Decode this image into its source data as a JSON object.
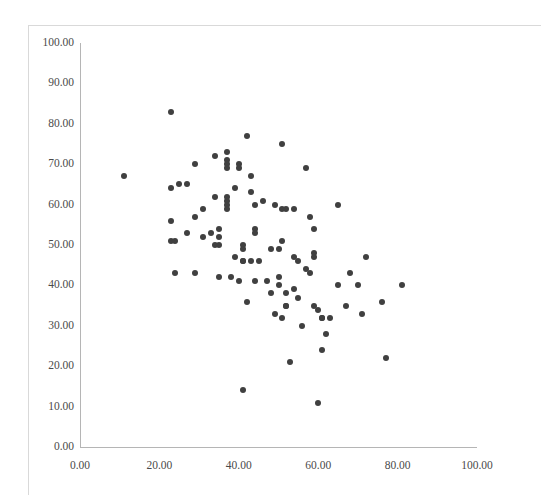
{
  "chart_data": {
    "type": "scatter",
    "title": "",
    "xlabel": "",
    "ylabel": "",
    "xlim": [
      0,
      100
    ],
    "ylim": [
      0,
      100
    ],
    "grid": false,
    "legend": null,
    "marker": {
      "shape": "circle",
      "color": "#404040",
      "size_px": 6
    },
    "x_ticks": [
      "0.00",
      "20.00",
      "40.00",
      "60.00",
      "80.00",
      "100.00"
    ],
    "x_tick_values": [
      0,
      20,
      40,
      60,
      80,
      100
    ],
    "y_ticks": [
      "0.00",
      "10.00",
      "20.00",
      "30.00",
      "40.00",
      "50.00",
      "60.00",
      "70.00",
      "80.00",
      "90.00",
      "100.00"
    ],
    "y_tick_values": [
      0,
      10,
      20,
      30,
      40,
      50,
      60,
      70,
      80,
      90,
      100
    ],
    "points": [
      [
        11,
        67
      ],
      [
        23,
        83
      ],
      [
        23,
        64
      ],
      [
        23,
        56
      ],
      [
        23,
        51
      ],
      [
        24,
        51
      ],
      [
        24,
        43
      ],
      [
        25,
        65
      ],
      [
        27,
        65
      ],
      [
        27,
        53
      ],
      [
        29,
        70
      ],
      [
        29,
        57
      ],
      [
        29,
        43
      ],
      [
        31,
        59
      ],
      [
        31,
        52
      ],
      [
        33,
        53
      ],
      [
        34,
        72
      ],
      [
        34,
        62
      ],
      [
        34,
        50
      ],
      [
        35,
        54
      ],
      [
        35,
        52
      ],
      [
        35,
        50
      ],
      [
        35,
        42
      ],
      [
        37,
        73
      ],
      [
        37,
        71
      ],
      [
        37,
        70
      ],
      [
        37,
        69
      ],
      [
        37,
        62
      ],
      [
        37,
        61
      ],
      [
        37,
        60
      ],
      [
        37,
        59
      ],
      [
        38,
        42
      ],
      [
        39,
        64
      ],
      [
        39,
        47
      ],
      [
        40,
        41
      ],
      [
        40,
        70
      ],
      [
        40,
        69
      ],
      [
        41,
        14
      ],
      [
        41,
        50
      ],
      [
        41,
        49
      ],
      [
        41,
        46
      ],
      [
        41,
        46
      ],
      [
        42,
        77
      ],
      [
        42,
        36
      ],
      [
        43,
        67
      ],
      [
        43,
        63
      ],
      [
        43,
        46
      ],
      [
        44,
        60
      ],
      [
        44,
        54
      ],
      [
        44,
        53
      ],
      [
        44,
        41
      ],
      [
        45,
        46
      ],
      [
        46,
        61
      ],
      [
        47,
        41
      ],
      [
        48,
        49
      ],
      [
        48,
        38
      ],
      [
        49,
        60
      ],
      [
        49,
        33
      ],
      [
        50,
        49
      ],
      [
        50,
        42
      ],
      [
        50,
        40
      ],
      [
        51,
        75
      ],
      [
        51,
        59
      ],
      [
        51,
        51
      ],
      [
        51,
        32
      ],
      [
        52,
        59
      ],
      [
        52,
        38
      ],
      [
        52,
        35
      ],
      [
        52,
        35
      ],
      [
        53,
        21
      ],
      [
        54,
        59
      ],
      [
        54,
        47
      ],
      [
        54,
        39
      ],
      [
        55,
        37
      ],
      [
        55,
        46
      ],
      [
        56,
        30
      ],
      [
        57,
        69
      ],
      [
        57,
        44
      ],
      [
        58,
        57
      ],
      [
        58,
        43
      ],
      [
        59,
        48
      ],
      [
        59,
        47
      ],
      [
        59,
        54
      ],
      [
        59,
        35
      ],
      [
        60,
        11
      ],
      [
        60,
        34
      ],
      [
        61,
        32
      ],
      [
        61,
        32
      ],
      [
        61,
        24
      ],
      [
        62,
        28
      ],
      [
        63,
        32
      ],
      [
        65,
        60
      ],
      [
        65,
        40
      ],
      [
        67,
        35
      ],
      [
        68,
        43
      ],
      [
        70,
        40
      ],
      [
        71,
        33
      ],
      [
        72,
        47
      ],
      [
        76,
        36
      ],
      [
        77,
        22
      ],
      [
        81,
        40
      ]
    ]
  }
}
